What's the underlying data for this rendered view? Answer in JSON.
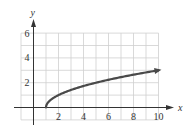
{
  "chart_data": {
    "type": "line",
    "title": "",
    "xlabel": "x",
    "ylabel": "y",
    "xlim": [
      -1,
      10
    ],
    "ylim": [
      -1,
      6
    ],
    "grid": true,
    "x_ticks": [
      2,
      4,
      6,
      8,
      10
    ],
    "y_ticks": [
      2,
      4,
      6
    ],
    "x_tick_labels": [
      "2",
      "4",
      "6",
      "8",
      "10"
    ],
    "y_tick_labels": [
      "2",
      "4",
      "6"
    ],
    "series": [
      {
        "name": "y = sqrt(x - 1)",
        "x": [
          1,
          1.25,
          1.5,
          2,
          3,
          4,
          5,
          6,
          7,
          8,
          9,
          10
        ],
        "y": [
          0,
          0.5,
          0.71,
          1,
          1.41,
          1.73,
          2,
          2.24,
          2.45,
          2.65,
          2.83,
          3
        ],
        "start_point": [
          1,
          0
        ],
        "end_arrow": true
      }
    ],
    "colors": {
      "curve": "#4a4a4a",
      "axis": "#333333",
      "grid": "#cfcfcf"
    }
  }
}
